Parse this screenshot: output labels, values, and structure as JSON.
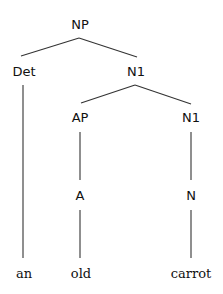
{
  "tree": {
    "nodes": {
      "np": "NP",
      "det": "Det",
      "n1_top": "N1",
      "ap": "AP",
      "n1_bottom": "N1",
      "a": "A",
      "n": "N"
    },
    "words": {
      "an": "an",
      "old": "old",
      "carrot": "carrot"
    }
  }
}
